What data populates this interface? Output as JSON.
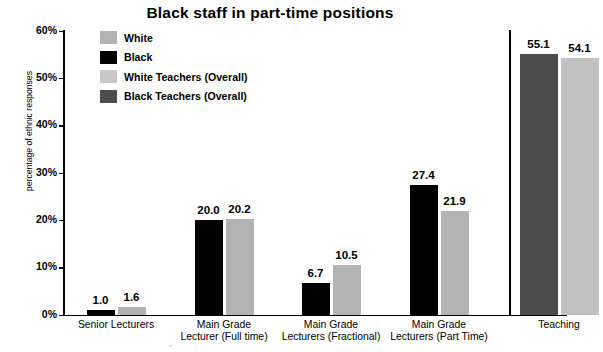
{
  "chart_data": {
    "type": "bar",
    "title": "Black staff in part-time positions",
    "xlabel": "",
    "ylabel": "percentage of ethnic responses",
    "ylim": [
      0,
      60
    ],
    "yticks": [
      "0%",
      "10%",
      "20%",
      "30%",
      "40%",
      "50%",
      "60%"
    ],
    "ytick_values": [
      0,
      10,
      20,
      30,
      40,
      50,
      60
    ],
    "grid": false,
    "legend_position": "upper-left-inside",
    "categories": [
      "Senior Lecturers",
      "Main Grade Lecturer (Full time)",
      "Main Grade Lecturers (Fractional)",
      "Main Grade Lecturers (Part Time)",
      "Teaching"
    ],
    "category_lines": [
      [
        "Senior Lecturers"
      ],
      [
        "Main Grade",
        "Lecturer (Full time)"
      ],
      [
        "Main Grade",
        "Lecturers (Fractional)"
      ],
      [
        "Main Grade",
        "Lecturers (Part Time)"
      ],
      [
        "Teaching"
      ]
    ],
    "series": [
      {
        "name": "Black",
        "color": "#000000",
        "values": [
          1.0,
          20.0,
          6.7,
          27.4,
          null
        ],
        "labels": [
          "1.0",
          "20.0",
          "6.7",
          "27.4",
          ""
        ]
      },
      {
        "name": "White",
        "color": "#b3b3b3",
        "values": [
          1.6,
          20.2,
          10.5,
          21.9,
          null
        ],
        "labels": [
          "1.6",
          "20.2",
          "10.5",
          "21.9",
          ""
        ]
      },
      {
        "name": "Black Teachers (Overall)",
        "color": "#4d4d4d",
        "values": [
          null,
          null,
          null,
          null,
          55.1
        ],
        "labels": [
          "",
          "",
          "",
          "",
          "55.1"
        ]
      },
      {
        "name": "White Teachers (Overall)",
        "color": "#c0c0c0",
        "values": [
          null,
          null,
          null,
          null,
          54.1
        ],
        "labels": [
          "",
          "",
          "",
          "",
          "54.1"
        ]
      }
    ],
    "legend": [
      {
        "label": "White",
        "color": "#b3b3b3"
      },
      {
        "label": "Black",
        "color": "#000000"
      },
      {
        "label": "White Teachers (Overall)",
        "color": "#c8c8c8"
      },
      {
        "label": "Black Teachers (Overall)",
        "color": "#4d4d4d"
      }
    ],
    "footnote": "'"
  }
}
